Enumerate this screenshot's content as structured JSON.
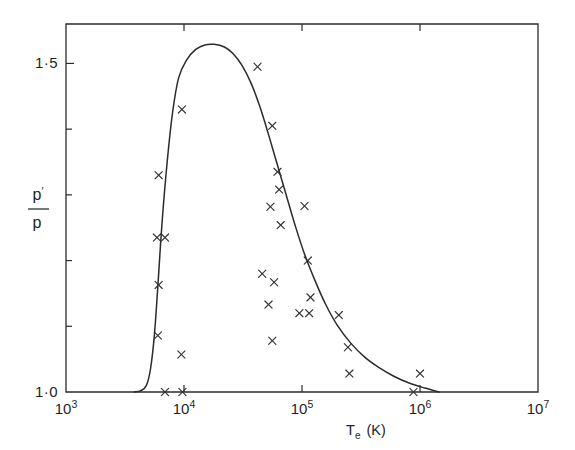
{
  "chart_data": {
    "type": "scatter",
    "title": "",
    "subtitle": "",
    "xlabel": "T_e (K)",
    "xlabel_base": "T",
    "xlabel_sub": "e",
    "xlabel_unit": "(K)",
    "ylabel": "p'/p",
    "ylabel_numerator": "p",
    "ylabel_numerator_prime": "′",
    "ylabel_denominator": "p",
    "xscale": "log",
    "yscale": "linear",
    "xlim": [
      1000,
      10000000
    ],
    "ylim": [
      1.0,
      1.56
    ],
    "grid": false,
    "legend": null,
    "x_ticks": [
      {
        "value": 1000,
        "mantissa": "10",
        "exponent": "3",
        "label": "10³"
      },
      {
        "value": 10000,
        "mantissa": "10",
        "exponent": "4",
        "label": "10⁴"
      },
      {
        "value": 100000,
        "mantissa": "10",
        "exponent": "5",
        "label": "10⁵"
      },
      {
        "value": 1000000,
        "mantissa": "10",
        "exponent": "6",
        "label": "10⁶"
      },
      {
        "value": 10000000,
        "mantissa": "10",
        "exponent": "7",
        "label": "10⁷"
      }
    ],
    "y_ticks": [
      {
        "value": 1.0,
        "label": "1·0",
        "labelled": true
      },
      {
        "value": 1.1,
        "label": "",
        "labelled": false
      },
      {
        "value": 1.2,
        "label": "",
        "labelled": false
      },
      {
        "value": 1.3,
        "label": "",
        "labelled": false
      },
      {
        "value": 1.4,
        "label": "",
        "labelled": false
      },
      {
        "value": 1.5,
        "label": "1·5",
        "labelled": true
      }
    ],
    "series": [
      {
        "name": "theoretical curve",
        "type": "line",
        "style": "solid",
        "color": "#2b2b2b",
        "points": [
          [
            3800,
            1.0
          ],
          [
            4300,
            1.002
          ],
          [
            4800,
            1.01
          ],
          [
            5200,
            1.035
          ],
          [
            5600,
            1.085
          ],
          [
            6000,
            1.16
          ],
          [
            6500,
            1.255
          ],
          [
            7200,
            1.35
          ],
          [
            8000,
            1.425
          ],
          [
            9000,
            1.478
          ],
          [
            10500,
            1.505
          ],
          [
            12500,
            1.521
          ],
          [
            15000,
            1.528
          ],
          [
            18000,
            1.529
          ],
          [
            22000,
            1.525
          ],
          [
            26000,
            1.515
          ],
          [
            31000,
            1.497
          ],
          [
            37000,
            1.47
          ],
          [
            44000,
            1.434
          ],
          [
            52000,
            1.392
          ],
          [
            62000,
            1.345
          ],
          [
            74000,
            1.298
          ],
          [
            88000,
            1.252
          ],
          [
            105000,
            1.21
          ],
          [
            130000,
            1.168
          ],
          [
            160000,
            1.132
          ],
          [
            200000,
            1.101
          ],
          [
            260000,
            1.074
          ],
          [
            340000,
            1.053
          ],
          [
            450000,
            1.037
          ],
          [
            600000,
            1.024
          ],
          [
            800000,
            1.014
          ],
          [
            1100000,
            1.006
          ],
          [
            1450000,
            1.0
          ]
        ]
      },
      {
        "name": "measured points",
        "type": "scatter",
        "marker": "x",
        "color": "#333333",
        "points": [
          [
            6100,
            1.33
          ],
          [
            5900,
            1.235
          ],
          [
            6900,
            1.235
          ],
          [
            6100,
            1.163
          ],
          [
            6000,
            1.086
          ],
          [
            6900,
            1.0
          ],
          [
            9700,
            1.0
          ],
          [
            9600,
            1.43
          ],
          [
            9500,
            1.057
          ],
          [
            42000,
            1.495
          ],
          [
            56000,
            1.405
          ],
          [
            54000,
            1.282
          ],
          [
            62000,
            1.335
          ],
          [
            64000,
            1.308
          ],
          [
            66000,
            1.254
          ],
          [
            46000,
            1.18
          ],
          [
            58000,
            1.167
          ],
          [
            52000,
            1.133
          ],
          [
            56000,
            1.078
          ],
          [
            105000,
            1.283
          ],
          [
            112000,
            1.2
          ],
          [
            118000,
            1.144
          ],
          [
            95000,
            1.12
          ],
          [
            115000,
            1.12
          ],
          [
            205000,
            1.117
          ],
          [
            245000,
            1.068
          ],
          [
            252000,
            1.028
          ],
          [
            1000000,
            1.028
          ],
          [
            880000,
            1.0
          ]
        ]
      }
    ]
  }
}
